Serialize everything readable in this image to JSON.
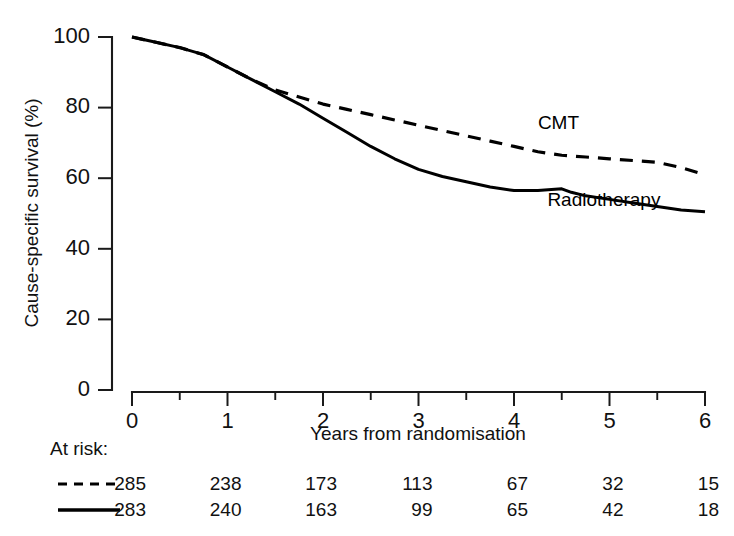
{
  "chart_data": {
    "type": "line",
    "title": "",
    "xlabel": "Years from randomisation",
    "ylabel": "Cause-specific survival (%)",
    "xlim": [
      0,
      6
    ],
    "ylim": [
      0,
      100
    ],
    "xticks": [
      0,
      1,
      2,
      3,
      4,
      5,
      6
    ],
    "xtick_labels": [
      "0",
      "1",
      "2",
      "3",
      "4",
      "5",
      "6"
    ],
    "xminor_ticks": [
      0.5,
      1.5,
      2.5,
      3.5,
      4.5,
      5.5
    ],
    "yticks": [
      0,
      20,
      40,
      60,
      80,
      100
    ],
    "ytick_labels": [
      "0",
      "20",
      "40",
      "60",
      "80",
      "100"
    ],
    "grid": false,
    "legend_position": "inline-annotation",
    "series": [
      {
        "name": "CMT",
        "style": "dashed",
        "color": "#000000",
        "label_x": 4.25,
        "label_y": 74,
        "x": [
          0,
          0.25,
          0.5,
          0.75,
          1.0,
          1.25,
          1.5,
          1.75,
          2.0,
          2.25,
          2.5,
          2.75,
          3.0,
          3.25,
          3.5,
          3.75,
          4.0,
          4.25,
          4.5,
          4.75,
          5.0,
          5.25,
          5.5,
          5.75,
          6.0
        ],
        "y": [
          100,
          98.5,
          97,
          95,
          91.5,
          88,
          85,
          83,
          81,
          79.5,
          78,
          76.5,
          75,
          73.5,
          72,
          70.5,
          69,
          67.5,
          66.5,
          66,
          65.5,
          65,
          64.5,
          63,
          61
        ]
      },
      {
        "name": "Radiotherapy",
        "style": "solid",
        "color": "#000000",
        "label_x": 4.35,
        "label_y": 52,
        "x": [
          0,
          0.25,
          0.5,
          0.75,
          1.0,
          1.25,
          1.5,
          1.75,
          2.0,
          2.25,
          2.5,
          2.75,
          3.0,
          3.25,
          3.5,
          3.75,
          4.0,
          4.25,
          4.5,
          4.6,
          4.75,
          5.0,
          5.25,
          5.5,
          5.75,
          6.0
        ],
        "y": [
          100,
          98.5,
          97,
          95,
          91.5,
          88,
          84.5,
          81,
          77,
          73,
          69,
          65.5,
          62.5,
          60.5,
          59,
          57.5,
          56.5,
          56.5,
          57,
          56,
          55,
          54,
          53,
          52,
          51,
          50.5
        ]
      }
    ]
  },
  "at_risk": {
    "label": "At risk:",
    "columns": [
      "0",
      "1",
      "2",
      "3",
      "4",
      "5",
      "6"
    ],
    "rows": [
      {
        "series": "CMT",
        "style": "dashed",
        "values": [
          "285",
          "238",
          "173",
          "113",
          "67",
          "32",
          "15"
        ]
      },
      {
        "series": "Radiotherapy",
        "style": "solid",
        "values": [
          "283",
          "240",
          "163",
          "99",
          "65",
          "42",
          "18"
        ]
      }
    ]
  }
}
